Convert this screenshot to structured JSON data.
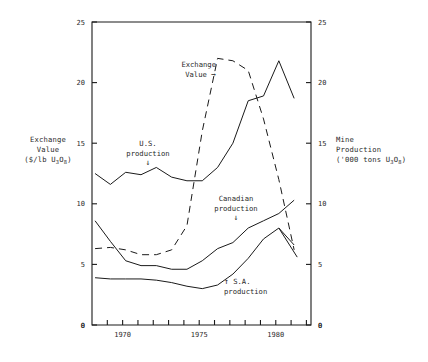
{
  "figure": {
    "background_color": "#ffffff",
    "ink_color": "#1a1a1a"
  },
  "left_axis": {
    "title_line1": "Exchange",
    "title_line2": "Value",
    "units_prefix": "($/lb U",
    "units_sub1": "3",
    "units_mid": "O",
    "units_sub2": "8",
    "units_suffix": ")",
    "ticks": [
      "25",
      "20",
      "15",
      "10",
      "5",
      "0"
    ],
    "min": 0,
    "max": 25
  },
  "right_axis": {
    "title_line1": "Mine",
    "title_line2": "Production",
    "units_prefix": "('000 tons U",
    "units_sub1": "3",
    "units_mid": "O",
    "units_sub2": "8",
    "units_suffix": ")",
    "ticks": [
      "25",
      "20",
      "15",
      "10",
      "5",
      "0"
    ],
    "min": 0,
    "max": 25
  },
  "x_axis": {
    "origin_label": "0",
    "ticks": [
      "1970",
      "1975",
      "1980"
    ],
    "min": 1968,
    "max": 1982.3
  },
  "annotations": [
    {
      "name": "exchange-value",
      "line1": "Exchange",
      "line2": "Value",
      "arrow": "→",
      "arrow_inline": true
    },
    {
      "name": "us-production",
      "line1": "U.S.",
      "line2": "production",
      "arrow": "↓",
      "arrow_inline": false
    },
    {
      "name": "canadian-production",
      "line1": "Canadian",
      "line2": "production",
      "arrow": "↓",
      "arrow_inline": false
    },
    {
      "name": "sa-production",
      "line1": "S.A.",
      "line2": "production",
      "arrow": "↑",
      "arrow_inline": false
    }
  ],
  "chart_data": {
    "type": "line",
    "title": "",
    "subtitle": "",
    "xlabel": "",
    "ylabel": "Exchange Value ($/lb U3O8)",
    "ylabel_right": "Mine Production ('000 tons U3O8)",
    "xlim": [
      1968,
      1982.3
    ],
    "ylim": [
      0,
      25
    ],
    "ylim_right": [
      0,
      25
    ],
    "grid": false,
    "legend": "inline annotations",
    "x_tick_labels": [
      "1970",
      "1975",
      "1980"
    ],
    "x_tick_values": [
      1970,
      1975,
      1980
    ],
    "y_tick_values": [
      0,
      5,
      10,
      15,
      20,
      25
    ],
    "series": [
      {
        "name": "Exchange Value",
        "axis": "left",
        "style": "dashed",
        "units": "$/lb U3O8",
        "x": [
          1968.2,
          1969.2,
          1970.2,
          1971.2,
          1972.2,
          1973.2,
          1974.2,
          1975.2,
          1976.2,
          1977.2,
          1978.2,
          1979.2,
          1980.2,
          1981.2
        ],
        "y": [
          6.3,
          6.4,
          6.2,
          5.8,
          5.8,
          6.2,
          8.2,
          16.0,
          22.0,
          21.8,
          21.0,
          17.0,
          12.0,
          6.2
        ]
      },
      {
        "name": "U.S. production",
        "axis": "right",
        "style": "solid",
        "units": "'000 tons U3O8",
        "x": [
          1968.2,
          1969.2,
          1970.2,
          1971.2,
          1972.2,
          1973.2,
          1974.2,
          1975.2,
          1976.2,
          1977.2,
          1978.2,
          1979.2,
          1980.2,
          1981.2
        ],
        "y": [
          12.5,
          11.6,
          12.6,
          12.4,
          13.0,
          12.2,
          11.9,
          11.9,
          13.0,
          15.0,
          18.5,
          18.9,
          21.8,
          18.7
        ]
      },
      {
        "name": "Canadian production",
        "axis": "right",
        "style": "solid",
        "units": "'000 tons U3O8",
        "x": [
          1968.2,
          1969.2,
          1970.2,
          1971.2,
          1972.2,
          1973.2,
          1974.2,
          1975.2,
          1976.2,
          1977.2,
          1978.2,
          1979.2,
          1980.2,
          1981.2
        ],
        "y": [
          8.6,
          6.9,
          5.3,
          4.9,
          4.9,
          4.6,
          4.6,
          5.3,
          6.3,
          6.8,
          8.0,
          8.6,
          9.2,
          10.3
        ]
      },
      {
        "name": "S.A. production",
        "axis": "right",
        "style": "solid",
        "units": "'000 tons U3O8",
        "x": [
          1968.2,
          1969.2,
          1970.2,
          1971.2,
          1972.2,
          1973.2,
          1974.2,
          1975.2,
          1976.2,
          1977.2,
          1978.2,
          1979.2,
          1980.2,
          1981.2
        ],
        "y": [
          3.9,
          3.8,
          3.8,
          3.8,
          3.7,
          3.5,
          3.2,
          3.0,
          3.3,
          4.2,
          5.5,
          7.1,
          8.0,
          6.6
        ]
      },
      {
        "name": "S.A. production (branch)",
        "axis": "right",
        "style": "solid",
        "units": "'000 tons U3O8",
        "x": [
          1980.2,
          1981.4
        ],
        "y": [
          8.0,
          5.6
        ]
      }
    ]
  }
}
